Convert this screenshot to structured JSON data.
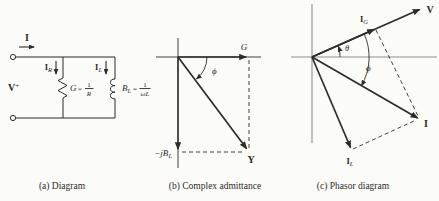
{
  "theme": {
    "page_bg": "#fbfbf8",
    "ink": "#2e2b28",
    "axis": "#8f8f8f"
  },
  "figure": {
    "panel_a": {
      "caption": "(a) Diagram",
      "current_label": "I",
      "current_r": {
        "base": "I",
        "sub": "R"
      },
      "current_l": {
        "base": "I",
        "sub": "L"
      },
      "voltage": {
        "base": "V",
        "sup": "+"
      },
      "conductance": {
        "sym": "G",
        "eq": "=",
        "num": "1",
        "den": "R"
      },
      "susceptance": {
        "sym": "B",
        "sym_sub": "L",
        "eq": "=",
        "num": "1",
        "den": "ωL"
      }
    },
    "panel_b": {
      "caption": "(b) Complex admittance",
      "g_label": "G",
      "phi_label": "ϕ",
      "neg_jbl": {
        "base": "−jB",
        "sub": "L"
      },
      "y_label": "Y"
    },
    "panel_c": {
      "caption": "(c) Phasor diagram",
      "v_label": "V",
      "i_g": {
        "base": "I",
        "sub": "G"
      },
      "i_label": "I",
      "i_l": {
        "base": "I",
        "sub": "L"
      },
      "theta_label": "θ",
      "phi_label": "ϕ"
    }
  }
}
